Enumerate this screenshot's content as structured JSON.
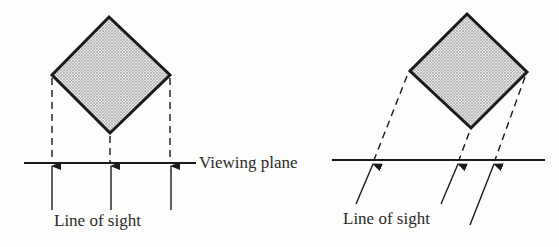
{
  "diagram": {
    "type": "projection-illustration",
    "colors": {
      "ink": "#1a1a1a",
      "fill": "#c8c8c8",
      "background": "#fdfdfc"
    },
    "labels": {
      "viewing_plane": "Viewing plane",
      "line_of_sight_left": "Line of sight",
      "line_of_sight_right": "Line of sight"
    },
    "panels": [
      {
        "name": "orthogonal-projection",
        "object": {
          "shape": "square rotated 45°",
          "fill": "stippled gray"
        },
        "projection_lines": "vertical dashed",
        "line_of_sight": "perpendicular to viewing plane",
        "arrow_count": 3
      },
      {
        "name": "oblique-projection",
        "object": {
          "shape": "square rotated 45°",
          "fill": "stippled gray"
        },
        "projection_lines": "oblique dashed",
        "line_of_sight": "oblique to viewing plane",
        "arrow_count": 3
      }
    ]
  }
}
